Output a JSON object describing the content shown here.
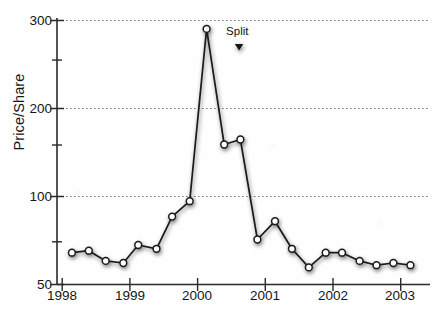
{
  "chart_data": {
    "type": "line",
    "title": "",
    "xlabel": "",
    "ylabel": "Price/Share",
    "grid": true,
    "legend": "none",
    "y_tick_labels": [
      "300",
      "200",
      "100",
      "50"
    ],
    "y_major_values": [
      300,
      200,
      100,
      50
    ],
    "y_minor_ticks": [
      250,
      150,
      70
    ],
    "ylim": [
      50,
      300
    ],
    "y_scale_note": "50, 100, 200, 300 equally spaced with midpoint minor ticks",
    "x_tick_labels": [
      "1998",
      "1999",
      "2000",
      "2001",
      "2002",
      "2003"
    ],
    "x_major_values": [
      1998,
      1999,
      2000,
      2001,
      2002,
      2003
    ],
    "xlim": [
      1998,
      2003.3
    ],
    "series": [
      {
        "name": "Price/Share",
        "marker": "circle",
        "marker_fill": "#ffffff",
        "marker_edge": "#1a1a1a",
        "line_color": "#1a1a1a",
        "x": [
          1998.15,
          1998.4,
          1998.65,
          1998.91,
          1999.13,
          1999.4,
          1999.63,
          1999.89,
          2000.14,
          2000.4,
          2000.64,
          2000.89,
          2001.15,
          2001.4,
          2001.65,
          2001.9,
          2002.14,
          2002.4,
          2002.65,
          2002.9,
          2003.15
        ],
        "y": [
          64,
          65,
          60,
          59,
          68,
          66,
          85,
          96,
          288,
          150,
          156,
          71,
          82,
          66,
          57,
          64,
          64,
          60,
          58,
          59,
          58
        ],
        "points": [
          {
            "x": 1998.15,
            "y": 64
          },
          {
            "x": 1998.4,
            "y": 65
          },
          {
            "x": 1998.65,
            "y": 60
          },
          {
            "x": 1998.91,
            "y": 59
          },
          {
            "x": 1999.13,
            "y": 68
          },
          {
            "x": 1999.4,
            "y": 66
          },
          {
            "x": 1999.63,
            "y": 85
          },
          {
            "x": 1999.89,
            "y": 96
          },
          {
            "x": 2000.14,
            "y": 288
          },
          {
            "x": 2000.4,
            "y": 150
          },
          {
            "x": 2000.64,
            "y": 156
          },
          {
            "x": 2000.89,
            "y": 71
          },
          {
            "x": 2001.15,
            "y": 82
          },
          {
            "x": 2001.4,
            "y": 66
          },
          {
            "x": 2001.65,
            "y": 57
          },
          {
            "x": 2001.9,
            "y": 64
          },
          {
            "x": 2002.14,
            "y": 64
          },
          {
            "x": 2002.4,
            "y": 60
          },
          {
            "x": 2002.65,
            "y": 58
          },
          {
            "x": 2002.9,
            "y": 59
          },
          {
            "x": 2003.15,
            "y": 58
          }
        ]
      }
    ],
    "annotations": [
      {
        "text": "Split",
        "marker": "down-triangle",
        "x": 2000.62,
        "label_y_px": 30,
        "marker_y_px": 44
      }
    ]
  }
}
